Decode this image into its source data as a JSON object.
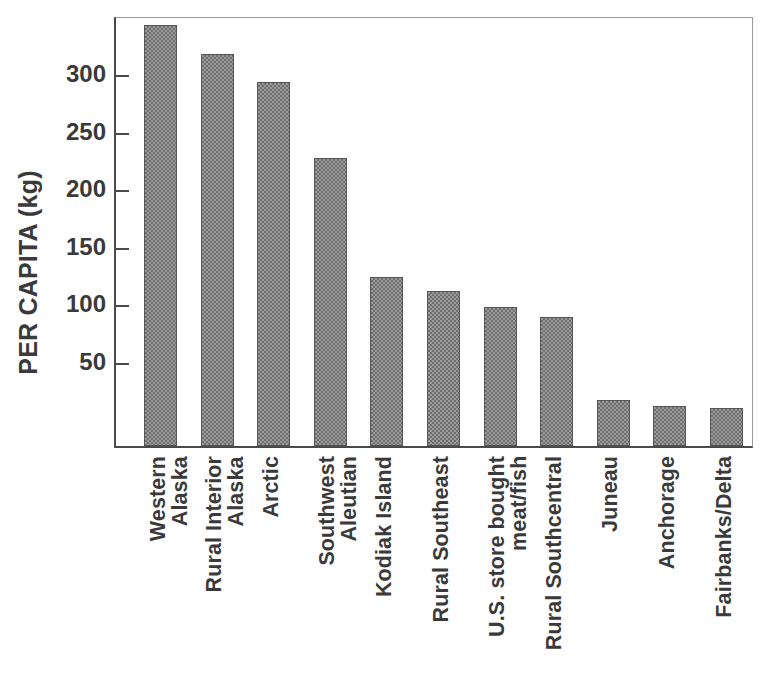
{
  "chart_data": {
    "type": "bar",
    "title": "",
    "xlabel": "",
    "ylabel": "PER CAPITA (kg)",
    "ylim": [
      -25,
      350
    ],
    "yticks": [
      50,
      100,
      150,
      200,
      250,
      300
    ],
    "ytick_labels": [
      "50",
      "100",
      "150",
      "200",
      "250",
      "300"
    ],
    "grid": false,
    "legend": "none",
    "categories": [
      "Western\nAlaska",
      "Rural Interior\nAlaska",
      "Arctic",
      "Southwest\nAleutian",
      "Kodiak Island",
      "Rural Southeast",
      "U.S. store bought\nmeat/fish",
      "Rural Southcentral",
      "Juneau",
      "Anchorage",
      "Fairbanks/Delta"
    ],
    "values": [
      341,
      316,
      292,
      226,
      122,
      110,
      96,
      87,
      15,
      10,
      8
    ],
    "bar_color": "#9b9b9b",
    "bar_edge_color": "#555555",
    "axis_color": "#4a4a4a",
    "text_color": "#3a3a3a"
  }
}
